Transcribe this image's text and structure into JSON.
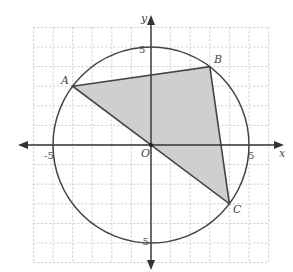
{
  "diagram": {
    "type": "coordinate-geometry",
    "axes": {
      "x_label": "x",
      "y_label": "y",
      "origin_label": "O"
    },
    "grid": {
      "xmin": -6,
      "xmax": 6,
      "ymin": -6,
      "ymax": 6,
      "style": "dashed"
    },
    "circle": {
      "center": [
        0,
        0
      ],
      "radius": 5
    },
    "tick_labels": {
      "x_neg": "-5",
      "x_pos": "5",
      "y_pos": "5",
      "y_neg": "-5"
    },
    "points": [
      {
        "name": "A",
        "x": -4,
        "y": 3
      },
      {
        "name": "B",
        "x": 3,
        "y": 4
      },
      {
        "name": "C",
        "x": 4,
        "y": -3
      }
    ],
    "shaded_region": "triangle ABC",
    "segment_through_origin": "AC",
    "colors": {
      "fill": "#cfcfcf",
      "line": "#444444",
      "grid": "#bbbbbb"
    }
  }
}
